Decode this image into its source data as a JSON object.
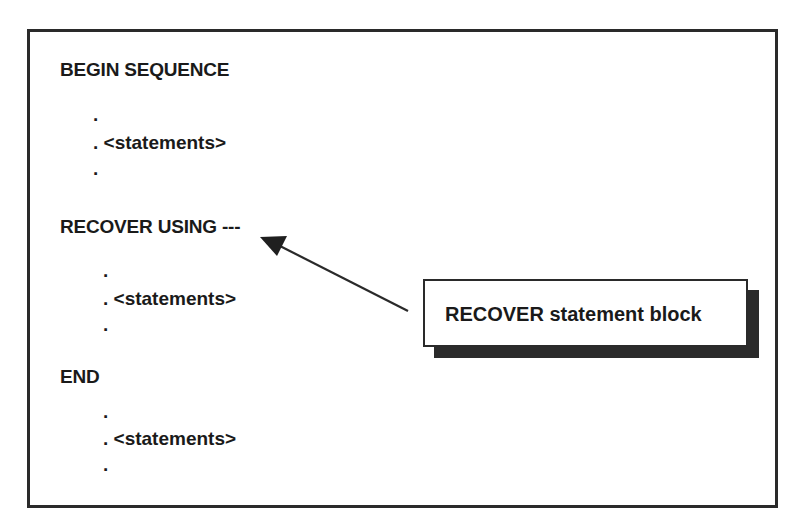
{
  "diagram": {
    "blocks": [
      {
        "keyword": "BEGIN SEQUENCE",
        "body": {
          "dot_top": ".",
          "statement": ". <statements>",
          "dot_bottom": "."
        }
      },
      {
        "keyword": "RECOVER USING ---",
        "body": {
          "dot_top": ".",
          "statement": ". <statements>",
          "dot_bottom": "."
        }
      },
      {
        "keyword": "END",
        "body": {
          "dot_top": ".",
          "statement": ". <statements>",
          "dot_bottom": "."
        }
      }
    ],
    "callout": {
      "label": "RECOVER statement block",
      "points_to": "RECOVER USING ---"
    },
    "colors": {
      "ink": "#1a1a1a",
      "border": "#2a2a2a",
      "shadow": "#2b2b2b",
      "background": "#ffffff"
    }
  }
}
